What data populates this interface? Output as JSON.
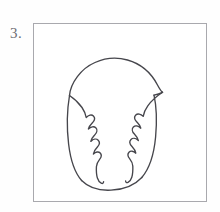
{
  "page": {
    "background_color": "#ffffff",
    "width": 220,
    "height": 212
  },
  "step": {
    "number": "3.",
    "label_color": "#6d6d72"
  },
  "frame": {
    "name": "drawing-frame",
    "border_color": "#a9a9ae",
    "fill_color": "#ffffff",
    "x": 33,
    "y": 23,
    "width": 174,
    "height": 179
  },
  "drawing": {
    "title": "acorn outline step 3",
    "ink_color": "#46464c",
    "stroke_width": 1.35,
    "parts": [
      {
        "name": "cap-dome",
        "description": "rounded dome cap across the top of the figure"
      },
      {
        "name": "cup-body",
        "description": "U-shaped cup below the cap forming the lower body"
      },
      {
        "name": "left-jagged-flap",
        "description": "serrated inner edge on the left side with three notches"
      },
      {
        "name": "right-jagged-flap",
        "description": "serrated inner edge on the right side with three notches"
      }
    ]
  }
}
